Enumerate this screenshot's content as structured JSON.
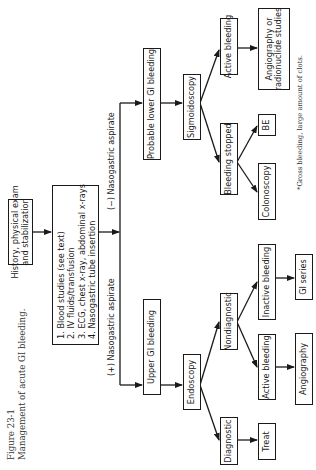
{
  "figure": {
    "number": "Figure 23-1",
    "title": "Management of acute GI bleeding."
  },
  "nodes": {
    "history": "History, physical exam\nand stabilization",
    "history_line1": "History, physical exam",
    "history_line2": "and stabilization",
    "steps": [
      "1. Blood studies (see text)",
      "2. IV fluids/transfusion",
      "3. ECG, chest x-ray, abdominal x-rays",
      "4. Nasogastric tube insertion"
    ],
    "upper_gi": "Upper GI bleeding",
    "lower_gi": "Probable lower GI bleeding",
    "endoscopy": "Endoscopy",
    "diagnostic": "Diagnostic",
    "nondiagnostic": "Nondiagnostic",
    "treat": "Treat",
    "active_bleeding_upper": "Active bleeding",
    "inactive_bleeding": "Inactive bleeding",
    "angiography": "Angiography",
    "gi_series": "GI series",
    "sigmoidoscopy": "Sigmoidoscopy",
    "active_bleeding_lower": "Active bleeding",
    "bleeding_stopped": "Bleeding stopped",
    "angio_radionuclide_line1": "Angiography or",
    "angio_radionuclide_line2": "radionuclide studies",
    "be": "BE",
    "colonoscopy": "Colonoscopy"
  },
  "edge_labels": {
    "positive": "(+)  Nasogastric aspirate",
    "negative": "(−)  Nasogastric aspirate"
  },
  "footnote": "*Gross bleeding, large amount of clots."
}
